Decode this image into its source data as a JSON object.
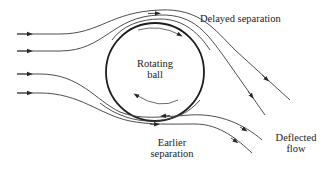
{
  "diagram": {
    "labels": {
      "ball_line1": "Rotating",
      "ball_line2": "ball",
      "delayed": "Delayed separation",
      "earlier_line1": "Earlier",
      "earlier_line2": "separation",
      "deflected_line1": "Deflected",
      "deflected_line2": "flow"
    },
    "colors": {
      "line": "#3a3a3a",
      "ball": "#1e1e1e",
      "text": "#222222",
      "background": "#ffffff"
    },
    "elements": {
      "incoming_streamlines": 4,
      "outgoing_streamlines_upper": 2,
      "outgoing_streamlines_lower": 2,
      "rotation_direction": "clockwise"
    }
  }
}
